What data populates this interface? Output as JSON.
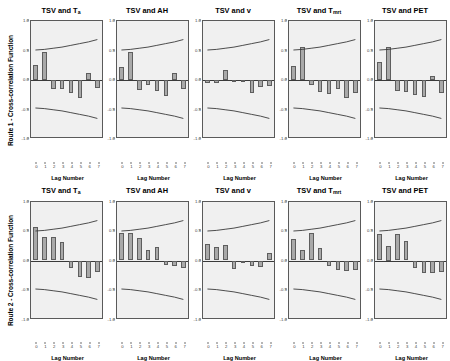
{
  "figure": {
    "x_axis_title": "Lag Number",
    "y_tick_labels": [
      "1.0",
      "0.5",
      "0.0",
      "-0.5",
      "-1.0"
    ],
    "y_tick_values": [
      1.0,
      0.5,
      0.0,
      -0.5,
      -1.0
    ],
    "x_tick_labels": [
      "0",
      "1",
      "2",
      "3",
      "4",
      "5",
      "6",
      "7"
    ],
    "bar_color": "#a9a9a9",
    "bar_border_color": "#5e5e5e",
    "plot_background": "#f0f0f0",
    "axis_color": "#5a5a5a"
  },
  "rows": [
    {
      "label": "Route 1 - Cross-correlation Function",
      "panels": [
        {
          "title_main": "TSV and T",
          "title_sub": "a",
          "title_full": "TSV and Ta"
        },
        {
          "title_main": "TSV and AH",
          "title_sub": "",
          "title_full": "TSV and AH"
        },
        {
          "title_main": "TSV and v",
          "title_sub": "",
          "title_full": "TSV and v"
        },
        {
          "title_main": "TSV and T",
          "title_sub": "mrt",
          "title_full": "TSV and Tmrt"
        },
        {
          "title_main": "TSV and PET",
          "title_sub": "",
          "title_full": "TSV and PET"
        }
      ]
    },
    {
      "label": "Route 2 - Cross-correlation Function",
      "panels": [
        {
          "title_main": "TSV and T",
          "title_sub": "a",
          "title_full": "TSV and Ta"
        },
        {
          "title_main": "TSV and AH",
          "title_sub": "",
          "title_full": "TSV and AH"
        },
        {
          "title_main": "TSV and v",
          "title_sub": "",
          "title_full": "TSV and v"
        },
        {
          "title_main": "TSV and T",
          "title_sub": "mrt",
          "title_full": "TSV and Tmrt"
        },
        {
          "title_main": "TSV and PET",
          "title_sub": "",
          "title_full": "TSV and PET"
        }
      ]
    }
  ],
  "chart_data": [
    {
      "type": "bar",
      "title": "TSV and Ta",
      "row": "Route 1 - Cross-correlation Function",
      "xlabel": "Lag Number",
      "ylabel": "Cross-correlation Function",
      "categories": [
        "0",
        "1",
        "2",
        "3",
        "4",
        "5",
        "6",
        "7"
      ],
      "values": [
        0.25,
        0.48,
        -0.16,
        -0.16,
        -0.22,
        -0.31,
        0.12,
        -0.13
      ],
      "ylim": [
        -1.0,
        1.0
      ],
      "grid": false,
      "confidence_upper": [
        0.5,
        0.51,
        0.53,
        0.55,
        0.58,
        0.61,
        0.64,
        0.68
      ],
      "confidence_lower": [
        -0.5,
        -0.51,
        -0.53,
        -0.55,
        -0.58,
        -0.61,
        -0.64,
        -0.68
      ]
    },
    {
      "type": "bar",
      "title": "TSV and AH",
      "row": "Route 1 - Cross-correlation Function",
      "xlabel": "Lag Number",
      "ylabel": "Cross-correlation Function",
      "categories": [
        "0",
        "1",
        "2",
        "3",
        "4",
        "5",
        "6",
        "7"
      ],
      "values": [
        0.22,
        0.48,
        -0.17,
        -0.09,
        -0.19,
        -0.27,
        0.12,
        -0.16
      ],
      "ylim": [
        -1.0,
        1.0
      ],
      "grid": false,
      "confidence_upper": [
        0.5,
        0.51,
        0.53,
        0.55,
        0.58,
        0.61,
        0.64,
        0.68
      ],
      "confidence_lower": [
        -0.5,
        -0.51,
        -0.53,
        -0.55,
        -0.58,
        -0.61,
        -0.64,
        -0.68
      ]
    },
    {
      "type": "bar",
      "title": "TSV and v",
      "row": "Route 1 - Cross-correlation Function",
      "xlabel": "Lag Number",
      "ylabel": "Cross-correlation Function",
      "categories": [
        "0",
        "1",
        "2",
        "3",
        "4",
        "5",
        "6",
        "7"
      ],
      "values": [
        -0.05,
        -0.05,
        0.17,
        0.0,
        -0.04,
        -0.22,
        -0.12,
        -0.1
      ],
      "ylim": [
        -1.0,
        1.0
      ],
      "grid": false,
      "confidence_upper": [
        0.5,
        0.51,
        0.53,
        0.55,
        0.58,
        0.61,
        0.64,
        0.68
      ],
      "confidence_lower": [
        -0.5,
        -0.51,
        -0.53,
        -0.55,
        -0.58,
        -0.61,
        -0.64,
        -0.68
      ]
    },
    {
      "type": "bar",
      "title": "TSV and Tmrt",
      "row": "Route 1 - Cross-correlation Function",
      "xlabel": "Lag Number",
      "ylabel": "Cross-correlation Function",
      "categories": [
        "0",
        "1",
        "2",
        "3",
        "4",
        "5",
        "6",
        "7"
      ],
      "values": [
        0.23,
        0.56,
        -0.09,
        -0.21,
        -0.23,
        -0.16,
        -0.31,
        -0.22
      ],
      "ylim": [
        -1.0,
        1.0
      ],
      "grid": false,
      "confidence_upper": [
        0.5,
        0.51,
        0.53,
        0.55,
        0.58,
        0.61,
        0.64,
        0.68
      ],
      "confidence_lower": [
        -0.5,
        -0.51,
        -0.53,
        -0.55,
        -0.58,
        -0.61,
        -0.64,
        -0.68
      ]
    },
    {
      "type": "bar",
      "title": "TSV and PET",
      "row": "Route 1 - Cross-correlation Function",
      "xlabel": "Lag Number",
      "ylabel": "Cross-correlation Function",
      "categories": [
        "0",
        "1",
        "2",
        "3",
        "4",
        "5",
        "6",
        "7"
      ],
      "values": [
        0.3,
        0.56,
        -0.18,
        -0.2,
        -0.25,
        -0.28,
        0.07,
        -0.22
      ],
      "ylim": [
        -1.0,
        1.0
      ],
      "grid": false,
      "confidence_upper": [
        0.5,
        0.51,
        0.53,
        0.55,
        0.58,
        0.61,
        0.64,
        0.68
      ],
      "confidence_lower": [
        -0.5,
        -0.51,
        -0.53,
        -0.55,
        -0.58,
        -0.61,
        -0.64,
        -0.68
      ]
    },
    {
      "type": "bar",
      "title": "TSV and Ta",
      "row": "Route 2 - Cross-correlation Function",
      "xlabel": "Lag Number",
      "ylabel": "Cross-correlation Function",
      "categories": [
        "0",
        "1",
        "2",
        "3",
        "4",
        "5",
        "6",
        "7"
      ],
      "values": [
        0.56,
        0.4,
        0.39,
        0.31,
        -0.13,
        -0.28,
        -0.29,
        -0.2
      ],
      "ylim": [
        -1.0,
        1.0
      ],
      "grid": false,
      "confidence_upper": [
        0.5,
        0.51,
        0.53,
        0.55,
        0.58,
        0.61,
        0.64,
        0.68
      ],
      "confidence_lower": [
        -0.5,
        -0.51,
        -0.53,
        -0.55,
        -0.58,
        -0.61,
        -0.64,
        -0.68
      ]
    },
    {
      "type": "bar",
      "title": "TSV and AH",
      "row": "Route 2 - Cross-correlation Function",
      "xlabel": "Lag Number",
      "ylabel": "Cross-correlation Function",
      "categories": [
        "0",
        "1",
        "2",
        "3",
        "4",
        "5",
        "6",
        "7"
      ],
      "values": [
        0.46,
        0.46,
        0.38,
        0.17,
        0.23,
        -0.07,
        -0.09,
        -0.12
      ],
      "ylim": [
        -1.0,
        1.0
      ],
      "grid": false,
      "confidence_upper": [
        0.5,
        0.51,
        0.53,
        0.55,
        0.58,
        0.61,
        0.64,
        0.68
      ],
      "confidence_lower": [
        -0.5,
        -0.51,
        -0.53,
        -0.55,
        -0.58,
        -0.61,
        -0.64,
        -0.68
      ]
    },
    {
      "type": "bar",
      "title": "TSV and v",
      "row": "Route 2 - Cross-correlation Function",
      "xlabel": "Lag Number",
      "ylabel": "Cross-correlation Function",
      "categories": [
        "0",
        "1",
        "2",
        "3",
        "4",
        "5",
        "6",
        "7"
      ],
      "values": [
        0.28,
        0.23,
        0.26,
        -0.14,
        -0.02,
        -0.09,
        -0.11,
        0.13
      ],
      "ylim": [
        -1.0,
        1.0
      ],
      "grid": false,
      "confidence_upper": [
        0.5,
        0.51,
        0.53,
        0.55,
        0.58,
        0.61,
        0.64,
        0.68
      ],
      "confidence_lower": [
        -0.5,
        -0.51,
        -0.53,
        -0.55,
        -0.58,
        -0.61,
        -0.64,
        -0.68
      ]
    },
    {
      "type": "bar",
      "title": "TSV and Tmrt",
      "row": "Route 2 - Cross-correlation Function",
      "xlabel": "Lag Number",
      "ylabel": "Cross-correlation Function",
      "categories": [
        "0",
        "1",
        "2",
        "3",
        "4",
        "5",
        "6",
        "7"
      ],
      "values": [
        0.36,
        0.17,
        0.47,
        0.22,
        -0.1,
        -0.16,
        -0.18,
        -0.16
      ],
      "ylim": [
        -1.0,
        1.0
      ],
      "grid": false,
      "confidence_upper": [
        0.5,
        0.51,
        0.53,
        0.55,
        0.58,
        0.61,
        0.64,
        0.68
      ],
      "confidence_lower": [
        -0.5,
        -0.51,
        -0.53,
        -0.55,
        -0.58,
        -0.61,
        -0.64,
        -0.68
      ]
    },
    {
      "type": "bar",
      "title": "TSV and PET",
      "row": "Route 2 - Cross-correlation Function",
      "xlabel": "Lag Number",
      "ylabel": "Cross-correlation Function",
      "categories": [
        "0",
        "1",
        "2",
        "3",
        "4",
        "5",
        "6",
        "7"
      ],
      "values": [
        0.45,
        0.25,
        0.45,
        0.33,
        -0.13,
        -0.22,
        -0.21,
        -0.2
      ],
      "ylim": [
        -1.0,
        1.0
      ],
      "grid": false,
      "confidence_upper": [
        0.5,
        0.51,
        0.53,
        0.55,
        0.58,
        0.61,
        0.64,
        0.68
      ],
      "confidence_lower": [
        -0.5,
        -0.51,
        -0.53,
        -0.55,
        -0.58,
        -0.61,
        -0.64,
        -0.68
      ]
    }
  ]
}
